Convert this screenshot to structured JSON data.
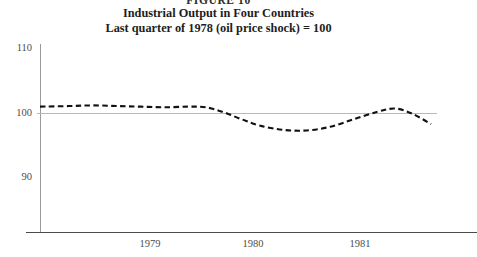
{
  "figure": {
    "number_label": "FIGURE 10",
    "title": "Industrial Output in Four Countries",
    "subtitle": "Last quarter of 1978 (oil price shock) = 100"
  },
  "axes": {
    "y_ticks": [
      "110",
      "100",
      "90"
    ],
    "x_ticks": [
      "1979",
      "1980",
      "1981"
    ]
  },
  "colors": {
    "series": "#111111",
    "gridline": "#b9b9b9",
    "axis_x": "#4a4a4a",
    "axis_y": "#9a9a9a",
    "text": "#1d1d1d"
  },
  "chart_data": {
    "type": "line",
    "title": "Industrial Output in Four Countries",
    "subtitle": "Last quarter of 1978 (oil price shock) = 100",
    "xlabel": "",
    "ylabel": "",
    "xlim": [
      1978.75,
      1982.1
    ],
    "ylim": [
      80,
      110
    ],
    "yticks": [
      90,
      100,
      110
    ],
    "xticks": [
      1979,
      1980,
      1981
    ],
    "grid": false,
    "gridlines_at": [
      100
    ],
    "legend": "none",
    "linestyle": "dashed",
    "series": [
      {
        "name": "Industrial output (four-country average)",
        "x": [
          1978.75,
          1979.0,
          1979.2,
          1979.4,
          1979.6,
          1979.8,
          1980.0,
          1980.15,
          1980.3,
          1980.45,
          1980.6,
          1980.8,
          1981.0,
          1981.2,
          1981.4,
          1981.6,
          1981.75,
          1981.9,
          1982.05
        ],
        "values": [
          100.0,
          100.1,
          100.2,
          100.1,
          100.0,
          99.9,
          100.0,
          99.9,
          99.1,
          98.0,
          97.0,
          96.3,
          96.2,
          96.8,
          98.0,
          99.2,
          99.7,
          98.8,
          97.2
        ]
      }
    ]
  }
}
